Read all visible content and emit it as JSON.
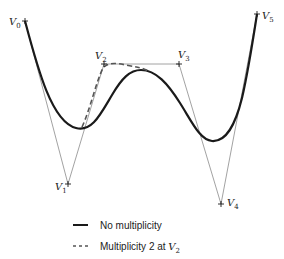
{
  "diagram": {
    "type": "b-spline-control-polygon",
    "control_points": [
      {
        "name": "V",
        "sub": "0",
        "x": 25,
        "y": 21
      },
      {
        "name": "V",
        "sub": "1",
        "x": 68,
        "y": 184
      },
      {
        "name": "V",
        "sub": "2",
        "x": 104,
        "y": 64
      },
      {
        "name": "V",
        "sub": "3",
        "x": 179,
        "y": 64
      },
      {
        "name": "V",
        "sub": "4",
        "x": 221,
        "y": 204
      },
      {
        "name": "V",
        "sub": "5",
        "x": 257,
        "y": 14
      }
    ],
    "curves": [
      {
        "name": "No multiplicity",
        "style": "solid"
      },
      {
        "name": "Multiplicity 2 at V2",
        "style": "dashed"
      }
    ],
    "colors": {
      "curve": "#1a1a1a",
      "polygon": "#888888",
      "text": "#222222"
    }
  },
  "legend": {
    "solid_label": "No multiplicity",
    "dashed_label_prefix": "Multiplicity 2 at ",
    "dashed_label_var": "V",
    "dashed_label_sub": "2"
  },
  "labels": {
    "v0": "V",
    "v0_sub": "0",
    "v1": "V",
    "v1_sub": "1",
    "v2": "V",
    "v2_sub": "2",
    "v3": "V",
    "v3_sub": "3",
    "v4": "V",
    "v4_sub": "4",
    "v5": "V",
    "v5_sub": "5"
  }
}
